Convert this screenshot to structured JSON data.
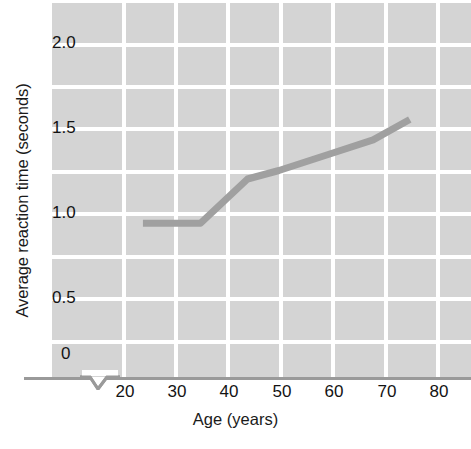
{
  "chart_data": {
    "type": "line",
    "title": "",
    "xlabel": "Age (years)",
    "ylabel": "Average reaction time (seconds)",
    "xlim": [
      20,
      85
    ],
    "ylim": [
      0,
      2.1
    ],
    "x_ticks": [
      20,
      30,
      40,
      50,
      60,
      70,
      80
    ],
    "x_tick_labels": [
      "20",
      "30",
      "40",
      "50",
      "60",
      "70",
      "80"
    ],
    "y_ticks": [
      0,
      0.5,
      1.0,
      1.5,
      2.0
    ],
    "y_tick_labels": [
      "0",
      "0.5",
      "1.0",
      "1.5",
      "2.0"
    ],
    "grid": true,
    "grid_color": "#ffffff",
    "plot_background": "#d4d4d4",
    "axis_break_x": true,
    "legend": null,
    "series": [
      {
        "name": "Average reaction time",
        "color": "#a0a0a0",
        "line_width": 7,
        "x": [
          24,
          35,
          44,
          50,
          60,
          68,
          75
        ],
        "y": [
          0.94,
          0.94,
          1.2,
          1.25,
          1.35,
          1.43,
          1.55
        ]
      }
    ]
  },
  "axes": {
    "y_title": "Average reaction time (seconds)",
    "x_title": "Age (years)",
    "y_labels": [
      "2.0",
      "1.5",
      "1.0",
      "0.5",
      "0"
    ],
    "x_labels": [
      "20",
      "30",
      "40",
      "50",
      "60",
      "70",
      "80"
    ]
  },
  "colors": {
    "line": "#a0a0a0",
    "plot_bg": "#d4d4d4",
    "grid": "#ffffff",
    "axis": "#9a9a9a",
    "text": "#131313",
    "page_bg": "#ffffff"
  }
}
